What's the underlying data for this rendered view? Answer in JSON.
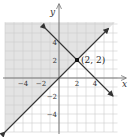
{
  "figure": {
    "type": "coordinate-plane-graph",
    "origin_px": [
      59,
      78
    ],
    "unit_px": 9,
    "x_range": [
      -6,
      6.5
    ],
    "y_range": [
      -6,
      6.2
    ],
    "axes": {
      "x_label": "x",
      "y_label": "y",
      "x_ticks": [
        {
          "value": -4,
          "label": "−4"
        },
        {
          "value": -2,
          "label": "−2"
        },
        {
          "value": 2,
          "label": "2"
        },
        {
          "value": 4,
          "label": "4"
        }
      ],
      "y_ticks": [
        {
          "value": 4,
          "label": "4"
        },
        {
          "value": 2,
          "label": "2"
        },
        {
          "value": -2,
          "label": "−2"
        },
        {
          "value": -4,
          "label": "−4"
        }
      ]
    },
    "lines": [
      {
        "name": "increasing-line",
        "equation": "y = x",
        "from": [
          -6,
          -6
        ],
        "to": [
          5.5,
          5.5
        ]
      },
      {
        "name": "decreasing-line",
        "equation": "y = -x + 4",
        "from": [
          -1.5,
          5.5
        ],
        "to": [
          6,
          -2
        ]
      }
    ],
    "intersection": {
      "x": 2,
      "y": 2,
      "label": "(2, 2)"
    },
    "shaded_region": {
      "description": "region above y = x and left of the graph",
      "color": "#e3e3e3"
    },
    "colors": {
      "grid": "#cfcfcf",
      "axis": "#777777",
      "line": "#333333",
      "shade": "#e3e3e3"
    }
  }
}
